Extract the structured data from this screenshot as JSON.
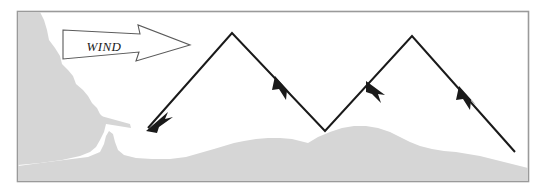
{
  "figure": {
    "name": "sailing-tacking-diagram",
    "frame": {
      "border_color": "#999999",
      "background_color": "#ffffff",
      "x": 17,
      "y": 11,
      "width": 512,
      "height": 171
    }
  },
  "wind_arrow": {
    "label": "WIND",
    "direction": "right",
    "outline_color": "#555555",
    "fill_color": "#ffffff",
    "label_x": 104,
    "label_y": 47
  },
  "land": {
    "name": "coastline",
    "fill_color": "#d6d6d6",
    "features": [
      "left-headland",
      "jetty",
      "harbor-inlet",
      "right-shore"
    ]
  },
  "course": {
    "name": "tacking-path",
    "stroke_color": "#1a1a1a",
    "stroke_width": 2,
    "direction_of_travel": "right-to-left",
    "vertices": [
      {
        "label": "start",
        "x": 515,
        "y": 152
      },
      {
        "label": "tack-point-2",
        "x": 412,
        "y": 36
      },
      {
        "label": "tack-point-1",
        "x": 325,
        "y": 131
      },
      {
        "label": "tack-point-0",
        "x": 232,
        "y": 33
      },
      {
        "label": "end-harbor-entrance",
        "x": 148,
        "y": 128
      }
    ],
    "arrowheads": [
      {
        "name": "arrowhead-leg-1",
        "x": 467,
        "y": 95
      },
      {
        "name": "arrowhead-leg-2",
        "x": 374,
        "y": 88
      },
      {
        "name": "arrowhead-leg-3",
        "x": 283,
        "y": 84
      },
      {
        "name": "arrowhead-leg-4",
        "x": 151,
        "y": 125
      }
    ]
  }
}
